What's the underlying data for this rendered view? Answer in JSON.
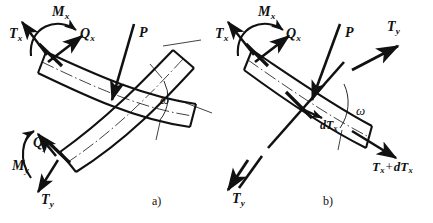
{
  "figure": {
    "background": "#ffffff",
    "ink": "#111111",
    "caption_a": "a)",
    "caption_b": "b)"
  },
  "panel_a": {
    "labels": {
      "Tx": {
        "base": "T",
        "sub": "x"
      },
      "Mx": {
        "base": "M",
        "sub": "x"
      },
      "Qx": {
        "base": "Q",
        "sub": "x"
      },
      "P": {
        "base": "P",
        "sub": ""
      },
      "omega": "ω",
      "Qy": {
        "base": "Q",
        "sub": "y"
      },
      "My": {
        "base": "M",
        "sub": "y"
      },
      "Ty": {
        "base": "T",
        "sub": "y"
      }
    }
  },
  "panel_b": {
    "labels": {
      "Tx": {
        "base": "T",
        "sub": "x"
      },
      "Mx": {
        "base": "M",
        "sub": "x"
      },
      "Qx": {
        "base": "Q",
        "sub": "x"
      },
      "P": {
        "base": "P",
        "sub": ""
      },
      "Ty_top": {
        "base": "T",
        "sub": "y"
      },
      "omega": "ω",
      "dTx": {
        "pre": "d",
        "base": "T",
        "sub": "x"
      },
      "TxdTx": {
        "base": "T",
        "sub": "x",
        "op": "+",
        "pre2": "d",
        "base2": "T",
        "sub2": "x"
      },
      "Ty_bottom": {
        "base": "T",
        "sub": "y"
      }
    }
  }
}
